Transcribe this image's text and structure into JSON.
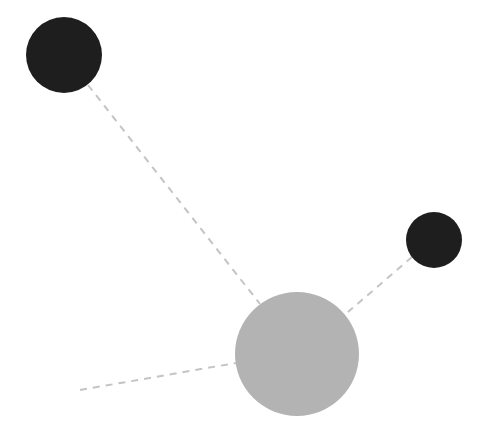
{
  "diagram": {
    "width": 492,
    "height": 436,
    "background": "#ffffff",
    "edge_style": {
      "color": "#c4c4c4",
      "width": 2,
      "dash": "7 6"
    },
    "nodes": [
      {
        "id": "node-top-left",
        "cx": 64,
        "cy": 55,
        "r": 38,
        "fill": "#1e1e1e"
      },
      {
        "id": "node-right",
        "cx": 434,
        "cy": 240,
        "r": 28,
        "fill": "#1e1e1e"
      },
      {
        "id": "node-center",
        "cx": 297,
        "cy": 354,
        "r": 62,
        "fill": "#b3b3b3"
      }
    ],
    "edges": [
      {
        "id": "edge-top-left-center",
        "x1": 88,
        "y1": 85,
        "x2": 260,
        "y2": 304
      },
      {
        "id": "edge-right-center",
        "x1": 412,
        "y1": 257,
        "x2": 348,
        "y2": 312
      },
      {
        "id": "edge-loose-center",
        "x1": 80,
        "y1": 390,
        "x2": 236,
        "y2": 363
      }
    ]
  }
}
